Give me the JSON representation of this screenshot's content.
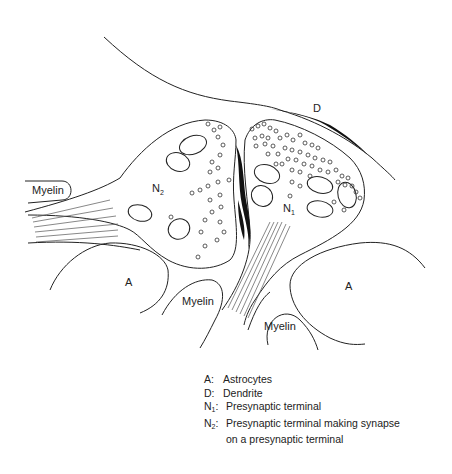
{
  "diagram": {
    "labels": {
      "dendrite": "D",
      "n1": "N",
      "n1_sub": "1",
      "n2": "N",
      "n2_sub": "2",
      "astrocyte_left": "A",
      "astrocyte_right": "A",
      "myelin_left": "Myelin",
      "myelin_center": "Myelin",
      "myelin_right": "Myelin"
    },
    "colors": {
      "stroke": "#222222",
      "background": "#ffffff"
    }
  },
  "legend": {
    "items": [
      {
        "key": "A:",
        "text": "Astrocytes"
      },
      {
        "key": "D:",
        "text": "Dendrite"
      },
      {
        "key": "N",
        "sub": "1",
        "colon": ":",
        "text": "Presynaptic terminal"
      },
      {
        "key": "N",
        "sub": "2",
        "colon": ":",
        "text": "Presynaptic terminal making synapse",
        "continuation": "on a presynaptic terminal"
      }
    ]
  }
}
